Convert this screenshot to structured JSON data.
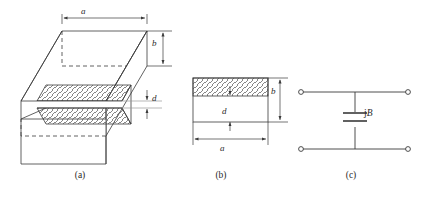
{
  "figure": {
    "background_color": "#ffffff",
    "line_color": "#3a3a3a",
    "hatch_color": "#555555"
  },
  "panels": [
    {
      "id": "a",
      "caption": "(a)",
      "description": "Three-dimensional oblique view of rectangular waveguide containing a capacitive iris",
      "dimensions": [
        {
          "name": "a",
          "label": "a",
          "orientation": "horizontal",
          "location": "top-face-width"
        },
        {
          "name": "b",
          "label": "b",
          "orientation": "vertical",
          "location": "right-face-height"
        },
        {
          "name": "d",
          "label": "d",
          "orientation": "vertical",
          "location": "iris-gap"
        }
      ]
    },
    {
      "id": "b",
      "caption": "(b)",
      "description": "Front cross-sectional view of the waveguide aperture",
      "dimensions": [
        {
          "name": "b",
          "label": "b",
          "orientation": "vertical",
          "location": "rectangle-height"
        },
        {
          "name": "d",
          "label": "d",
          "orientation": "vertical",
          "location": "aperture-gap"
        },
        {
          "name": "a",
          "label": "a",
          "orientation": "horizontal",
          "location": "rectangle-width"
        }
      ]
    },
    {
      "id": "c",
      "caption": "(c)",
      "description": "Equivalent circuit: shunt capacitive susceptance across a two-port transmission line",
      "component": {
        "type": "capacitor",
        "label_prefix": "j",
        "label_symbol": "B",
        "label_full": "jB"
      },
      "terminal_count": 4
    }
  ],
  "icons": {
    "terminal": "open-circle-terminal",
    "capacitor": "parallel-plate-capacitor",
    "arrow": "dimension-arrow",
    "hatch": "section-hatch-diagonal"
  }
}
